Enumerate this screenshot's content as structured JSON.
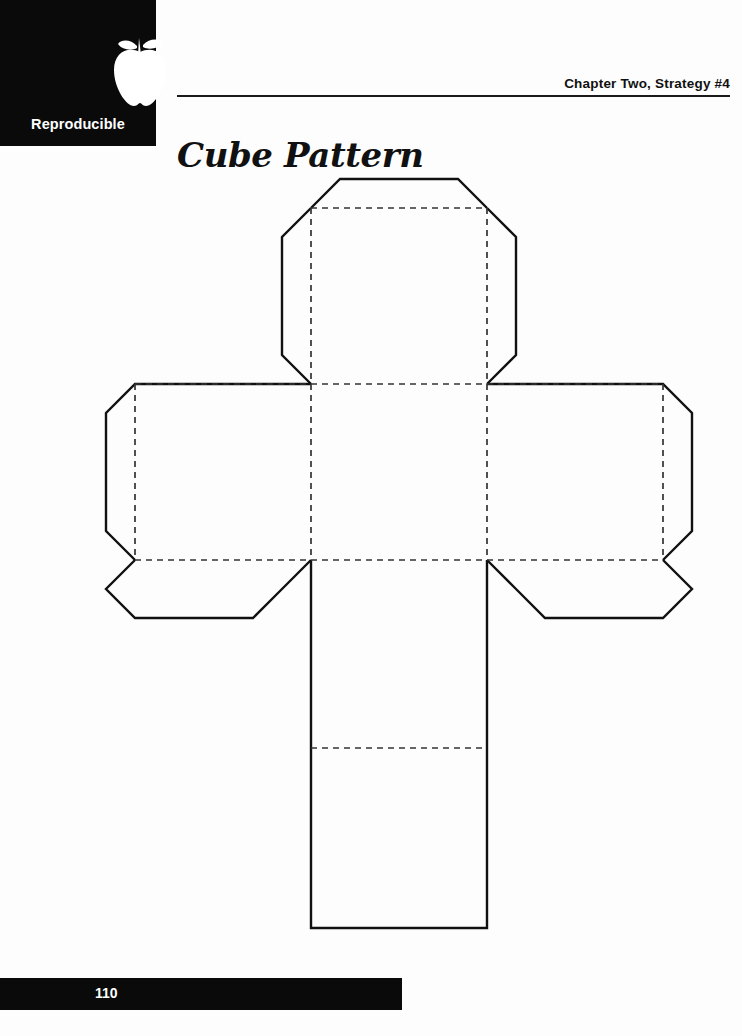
{
  "document": {
    "badge_label": "Reproducible",
    "badge_icon": "apple-icon",
    "chapter_line": "Chapter Two, Strategy #4",
    "title": "Cube Pattern",
    "page_number": "110",
    "colors": {
      "ink": "#111111",
      "badge_background": "#0a0a0a",
      "badge_text": "#ffffff",
      "paper": "#ffffff",
      "fold_line": "#333333"
    }
  },
  "diagram": {
    "name": "cube-net-pattern",
    "line_styles": {
      "cut_line": "solid",
      "fold_line": "dashed"
    },
    "geometry": {
      "cell": 176,
      "tab": 29,
      "chamfer": 29,
      "col_left": 135,
      "col_mid_left": 311,
      "col_mid_right": 487,
      "col_right": 663,
      "row_top": 208,
      "row_upper": 384,
      "row_lower": 560,
      "row_bottom": 736,
      "tail_fold": 748,
      "tail_end": 928
    },
    "faces": [
      {
        "name": "top-face",
        "x": 311,
        "y": 208,
        "w": 176,
        "h": 176
      },
      {
        "name": "left-face",
        "x": 135,
        "y": 384,
        "w": 176,
        "h": 176
      },
      {
        "name": "front-face",
        "x": 311,
        "y": 384,
        "w": 176,
        "h": 176
      },
      {
        "name": "right-face",
        "x": 487,
        "y": 384,
        "w": 176,
        "h": 176
      },
      {
        "name": "bottom-face",
        "x": 311,
        "y": 560,
        "w": 176,
        "h": 176
      },
      {
        "name": "back-face",
        "x": 311,
        "y": 736,
        "w": 176,
        "h": 192
      }
    ],
    "fold_lines": [
      {
        "name": "fold-top-horizontal",
        "x1": 311,
        "y1": 208,
        "x2": 487,
        "y2": 208
      },
      {
        "name": "fold-upper-horizontal",
        "x1": 135,
        "y1": 384,
        "x2": 663,
        "y2": 384
      },
      {
        "name": "fold-lower-horizontal",
        "x1": 135,
        "y1": 560,
        "x2": 663,
        "y2": 560
      },
      {
        "name": "fold-tail-horizontal",
        "x1": 311,
        "y1": 748,
        "x2": 487,
        "y2": 748
      },
      {
        "name": "fold-left-vertical",
        "x1": 311,
        "y1": 208,
        "x2": 311,
        "y2": 736
      },
      {
        "name": "fold-right-vertical",
        "x1": 487,
        "y1": 208,
        "x2": 487,
        "y2": 736
      },
      {
        "name": "fold-arm-left-vertical",
        "x1": 135,
        "y1": 384,
        "x2": 135,
        "y2": 560
      },
      {
        "name": "fold-arm-right-vertical",
        "x1": 663,
        "y1": 384,
        "x2": 663,
        "y2": 560
      }
    ]
  }
}
